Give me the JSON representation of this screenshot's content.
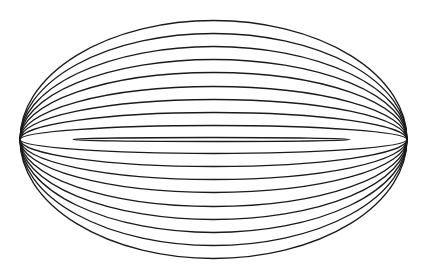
{
  "figure": {
    "width": 424,
    "height": 275,
    "background": "#ffffff",
    "stroke_color": "#1a1a1a",
    "stroke_width": 1.3,
    "center": {
      "cx": 213.5,
      "cy": 139.5
    },
    "ellipses": [
      {
        "rx": 193.5,
        "ry": 119
      },
      {
        "rx": 193.5,
        "ry": 106
      },
      {
        "rx": 193.5,
        "ry": 93
      },
      {
        "rx": 193.5,
        "ry": 80
      },
      {
        "rx": 193.5,
        "ry": 67
      },
      {
        "rx": 193.5,
        "ry": 53
      },
      {
        "rx": 193.5,
        "ry": 40
      },
      {
        "rx": 193.5,
        "ry": 27
      },
      {
        "rx": 193.5,
        "ry": 14
      },
      {
        "rx": 138.5,
        "ry": 2,
        "cx": 211.5
      }
    ]
  }
}
